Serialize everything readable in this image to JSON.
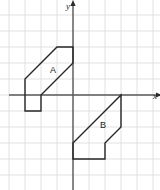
{
  "figure": {
    "background_color": "#ffffff",
    "width": 160,
    "height": 190
  },
  "grid": {
    "cell_size_px": 16,
    "color": "#d9d9d9",
    "line_width": 0.8,
    "visible": true,
    "x_lines_px": [
      9,
      25,
      41,
      57,
      73,
      89,
      105,
      121,
      137,
      153
    ],
    "y_lines_px": [
      15,
      31,
      47,
      63,
      79,
      95,
      111,
      127,
      143,
      159,
      175
    ]
  },
  "axes": {
    "color": "#5a5a5a",
    "line_width": 1.4,
    "origin_px": {
      "x": 73,
      "y": 95
    },
    "x_axis": {
      "label": "x",
      "label_px": {
        "x": 153,
        "y": 99
      },
      "start_px": {
        "x": 9,
        "y": 95
      },
      "end_px": {
        "x": 160,
        "y": 95
      },
      "arrow": "right"
    },
    "y_axis": {
      "label": "y",
      "label_px": {
        "x": 68,
        "y": 9
      },
      "start_px": {
        "x": 73,
        "y": 190
      },
      "end_px": {
        "x": 73,
        "y": 3
      },
      "arrow": "up"
    }
  },
  "shapes": [
    {
      "name": "A",
      "label": "A",
      "label_px": {
        "x": 53,
        "y": 73
      },
      "stroke": "#262626",
      "stroke_width": 1.4,
      "fill": "none",
      "quadrant": "II",
      "vertices_px": [
        {
          "x": 25,
          "y": 79
        },
        {
          "x": 41,
          "y": 63
        },
        {
          "x": 57,
          "y": 47
        },
        {
          "x": 73,
          "y": 47
        },
        {
          "x": 73,
          "y": 63
        },
        {
          "x": 41,
          "y": 95
        },
        {
          "x": 41,
          "y": 111
        },
        {
          "x": 25,
          "y": 111
        }
      ],
      "vertices_grid": [
        {
          "x": -3,
          "y": 1
        },
        {
          "x": -2,
          "y": 2
        },
        {
          "x": -1,
          "y": 3
        },
        {
          "x": 0,
          "y": 3
        },
        {
          "x": 0,
          "y": 2
        },
        {
          "x": -2,
          "y": 0
        },
        {
          "x": -2,
          "y": -1
        },
        {
          "x": -3,
          "y": -1
        }
      ]
    },
    {
      "name": "B",
      "label": "B",
      "label_px": {
        "x": 103,
        "y": 128
      },
      "stroke": "#262626",
      "stroke_width": 1.4,
      "fill": "none",
      "quadrant": "IV",
      "vertices_px": [
        {
          "x": 73,
          "y": 143
        },
        {
          "x": 89,
          "y": 127
        },
        {
          "x": 105,
          "y": 111
        },
        {
          "x": 121,
          "y": 95
        },
        {
          "x": 121,
          "y": 127
        },
        {
          "x": 105,
          "y": 143
        },
        {
          "x": 105,
          "y": 159
        },
        {
          "x": 73,
          "y": 159
        }
      ],
      "vertices_grid": [
        {
          "x": 0,
          "y": -3
        },
        {
          "x": 1,
          "y": -2
        },
        {
          "x": 2,
          "y": -1
        },
        {
          "x": 3,
          "y": 0
        },
        {
          "x": 3,
          "y": -2
        },
        {
          "x": 2,
          "y": -3
        },
        {
          "x": 2,
          "y": -4
        },
        {
          "x": 0,
          "y": -4
        }
      ]
    }
  ]
}
